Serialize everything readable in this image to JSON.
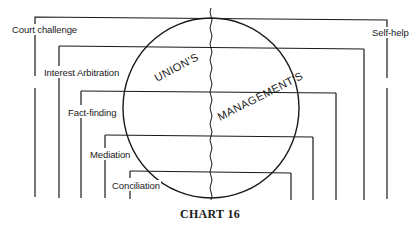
{
  "chart": {
    "caption": "CHART 16",
    "sides": {
      "left": "UNION'S",
      "right": "MANAGEMENT'S"
    },
    "left_labels": [
      {
        "label": "Court challenge"
      },
      {
        "label": "Interest Arbitration"
      },
      {
        "label": "Fact-finding"
      },
      {
        "label": "Mediation"
      },
      {
        "label": "Conciliation"
      }
    ],
    "right_labels": [
      {
        "label": "Self-help"
      }
    ]
  },
  "colors": {
    "line": "#1a1a1a",
    "background": "#ffffff"
  }
}
